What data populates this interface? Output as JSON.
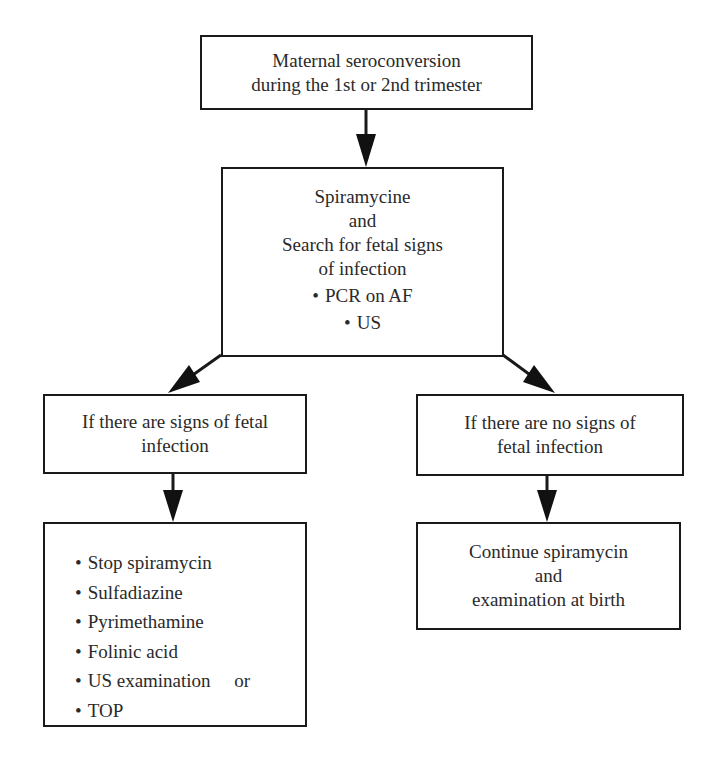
{
  "diagram": {
    "type": "flowchart",
    "colors": {
      "border": "#1a1a1a",
      "text": "#2a2a2a",
      "background": "#ffffff"
    },
    "nodes": {
      "start": {
        "lines": [
          "Maternal seroconversion",
          "during the 1st or 2nd trimester"
        ]
      },
      "treatment": {
        "lines": [
          "Spiramycine",
          "and",
          "Search for fetal signs",
          "of infection"
        ],
        "bullets": [
          "PCR on AF",
          "US"
        ]
      },
      "positive": {
        "lines": [
          "If there are signs of fetal",
          "infection"
        ]
      },
      "negative": {
        "lines": [
          "If there are no signs of",
          "fetal infection"
        ]
      },
      "positive_actions": {
        "items": [
          "Stop spiramycin",
          "Sulfadiazine",
          "Pyrimethamine",
          "Folinic acid",
          "US examination     or",
          "TOP"
        ]
      },
      "negative_actions": {
        "lines": [
          "Continue spiramycin",
          "and",
          "examination at birth"
        ]
      }
    },
    "edges": [
      {
        "from": "start",
        "to": "treatment"
      },
      {
        "from": "treatment",
        "to": "positive"
      },
      {
        "from": "treatment",
        "to": "negative"
      },
      {
        "from": "positive",
        "to": "positive_actions"
      },
      {
        "from": "negative",
        "to": "negative_actions"
      }
    ]
  }
}
